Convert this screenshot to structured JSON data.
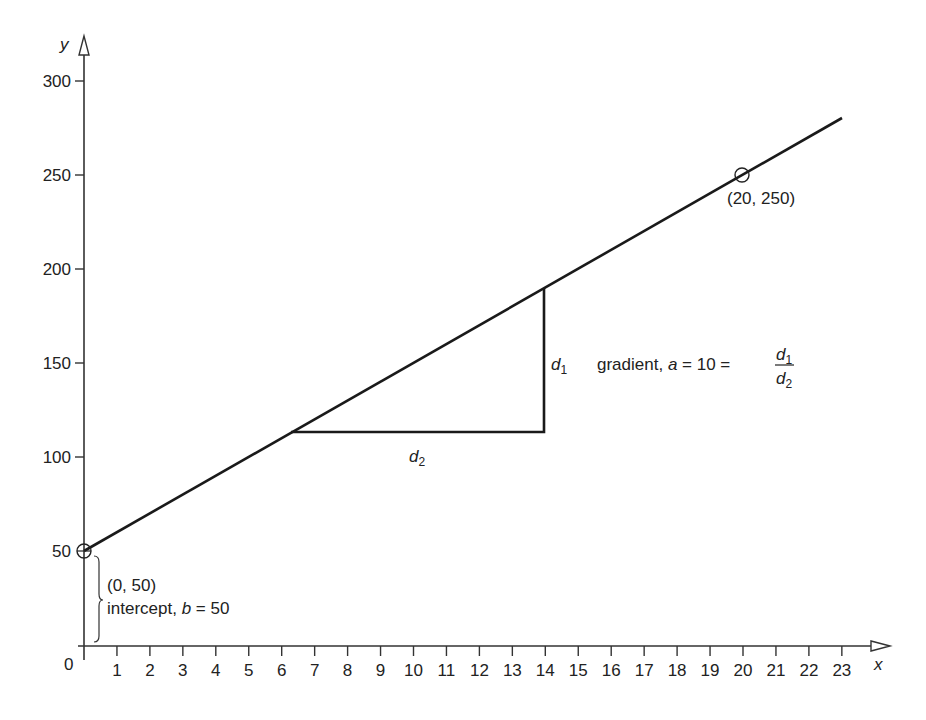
{
  "chart_data": {
    "type": "line",
    "title": "",
    "xlabel": "x",
    "ylabel": "y",
    "origin_label": "0",
    "x_ticks": [
      "1",
      "2",
      "3",
      "4",
      "5",
      "6",
      "7",
      "8",
      "9",
      "10",
      "11",
      "12",
      "13",
      "14",
      "15",
      "16",
      "17",
      "18",
      "19",
      "20",
      "21",
      "22",
      "23"
    ],
    "y_ticks": [
      "50",
      "100",
      "150",
      "200",
      "250",
      "300"
    ],
    "xlim": [
      0,
      23.5
    ],
    "ylim": [
      0,
      300
    ],
    "grid": false,
    "series": [
      {
        "name": "y = 10x + 50",
        "x": [
          0,
          23
        ],
        "y": [
          50,
          280
        ]
      }
    ],
    "points": [
      {
        "x": 0,
        "y": 50,
        "label": "(0, 50)",
        "marker": "circle"
      },
      {
        "x": 20,
        "y": 250,
        "label": "(20, 250)",
        "marker": "circle"
      }
    ],
    "slope_triangle": {
      "x_start": 6.3,
      "x_end": 14,
      "y_base": 113,
      "y_top": 190,
      "d1_label": "d",
      "d1_sub": "1",
      "d2_label": "d",
      "d2_sub": "2"
    },
    "annotations": {
      "intercept_point": "(0, 50)",
      "intercept_text_pre": "intercept, ",
      "intercept_var": "b",
      "intercept_text_post": " = 50",
      "gradient_text_pre": "gradient, ",
      "gradient_var": "a",
      "gradient_text_post": " = 10 = ",
      "fraction_num": "d",
      "fraction_num_sub": "1",
      "fraction_den": "d",
      "fraction_den_sub": "2"
    }
  }
}
